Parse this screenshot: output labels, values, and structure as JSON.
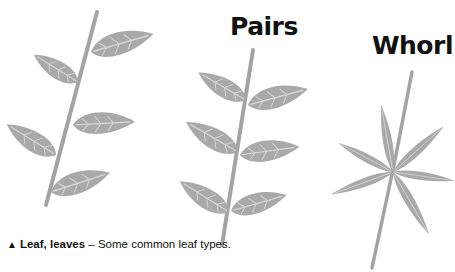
{
  "figure": {
    "headings": {
      "pairs": "Pairs",
      "whorl": "Whorl"
    },
    "diagrams": [
      {
        "name": "alternate",
        "label": "",
        "leaf_count": 5,
        "arrangement": "alternate leaves along stem"
      },
      {
        "name": "pairs",
        "label": "Pairs",
        "leaf_count": 6,
        "arrangement": "opposite leaves in pairs"
      },
      {
        "name": "whorl",
        "label": "Whorl",
        "leaf_count": 6,
        "arrangement": "leaves radiating from one node"
      }
    ],
    "colors": {
      "leaf_fill": "#a9a9a9",
      "leaf_vein": "#d6d6d6",
      "stem": "#a3a3a3",
      "text": "#111111",
      "background": "#ffffff"
    }
  },
  "caption": {
    "marker": "▲",
    "term": "Leaf, leaves",
    "separator": " – ",
    "description": "Some common leaf types."
  }
}
